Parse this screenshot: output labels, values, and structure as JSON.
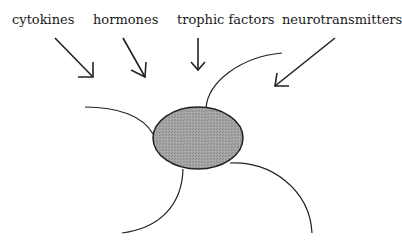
{
  "diagram": {
    "labels": [
      {
        "text": "cytokines",
        "x": 12,
        "y": 13
      },
      {
        "text": "hormones",
        "x": 93,
        "y": 13
      },
      {
        "text": "trophic factors",
        "x": 177,
        "y": 13
      },
      {
        "text": "neurotransmitters",
        "x": 282,
        "y": 13
      }
    ],
    "cell": {
      "shape": "ellipse",
      "cx": 198,
      "cy": 138,
      "rx": 45,
      "ry": 31,
      "fill": "#9a9a9a",
      "stroke": "#222222"
    },
    "arrows": [
      {
        "from": "cytokines",
        "x1": 55,
        "y1": 38,
        "x2": 93,
        "y2": 77
      },
      {
        "from": "hormones",
        "x1": 123,
        "y1": 38,
        "x2": 145,
        "y2": 77
      },
      {
        "from": "trophic factors",
        "x1": 198,
        "y1": 38,
        "x2": 198,
        "y2": 70
      },
      {
        "from": "neurotransmitters",
        "x1": 335,
        "y1": 38,
        "x2": 275,
        "y2": 86
      }
    ],
    "processes": 4,
    "colors": {
      "line": "#222222",
      "cell_fill": "#9a9a9a",
      "background": "#ffffff"
    }
  }
}
